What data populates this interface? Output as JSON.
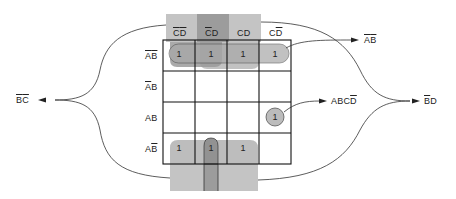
{
  "diagram": {
    "type": "karnaugh-map",
    "variables": [
      "A",
      "B",
      "C",
      "D"
    ],
    "columns": [
      {
        "label_parts": [
          {
            "t": "C",
            "bar": true
          },
          {
            "t": "D",
            "bar": true
          }
        ],
        "text": "C̄D̄"
      },
      {
        "label_parts": [
          {
            "t": "C",
            "bar": true
          },
          {
            "t": "D",
            "bar": false
          }
        ],
        "text": "C̄D"
      },
      {
        "label_parts": [
          {
            "t": "C",
            "bar": false
          },
          {
            "t": "D",
            "bar": false
          }
        ],
        "text": "CD"
      },
      {
        "label_parts": [
          {
            "t": "C",
            "bar": false
          },
          {
            "t": "D",
            "bar": true
          }
        ],
        "text": "CD̄"
      }
    ],
    "rows": [
      {
        "label_parts": [
          {
            "t": "A",
            "bar": true
          },
          {
            "t": "B",
            "bar": true
          }
        ],
        "text": "ĀB̄"
      },
      {
        "label_parts": [
          {
            "t": "A",
            "bar": true
          },
          {
            "t": "B",
            "bar": false
          }
        ],
        "text": "ĀB"
      },
      {
        "label_parts": [
          {
            "t": "A",
            "bar": false
          },
          {
            "t": "B",
            "bar": false
          }
        ],
        "text": "AB"
      },
      {
        "label_parts": [
          {
            "t": "A",
            "bar": false
          },
          {
            "t": "B",
            "bar": true
          }
        ],
        "text": "AB̄"
      }
    ],
    "cells": [
      [
        "1",
        "1",
        "1",
        "1"
      ],
      [
        "",
        "",
        "",
        ""
      ],
      [
        "",
        "",
        "",
        "1"
      ],
      [
        "1",
        "1",
        "1",
        ""
      ]
    ],
    "groups": [
      {
        "term": "ĀB̄",
        "term_parts": [
          {
            "t": "A",
            "bar": true
          },
          {
            "t": "B",
            "bar": true
          }
        ],
        "cells": "row 1, all columns"
      },
      {
        "term": "ABCD̄",
        "term_parts": [
          {
            "t": "A",
            "bar": false
          },
          {
            "t": "B",
            "bar": false
          },
          {
            "t": "C",
            "bar": false
          },
          {
            "t": "D",
            "bar": true
          }
        ],
        "cells": "row 3, column 4"
      },
      {
        "term": "B̄C̄",
        "term_parts": [
          {
            "t": "B",
            "bar": true
          },
          {
            "t": "C",
            "bar": true
          }
        ],
        "cells": "rows 1 & 4, columns 1-2 (wrap)"
      },
      {
        "term": "B̄D",
        "term_parts": [
          {
            "t": "B",
            "bar": true
          },
          {
            "t": "D",
            "bar": false
          }
        ],
        "cells": "rows 1 & 4, columns 2-3 (wrap)"
      }
    ],
    "cell_value": "1",
    "colors": {
      "grid_line": "#111111",
      "shade_light": "#c8c8c8",
      "shade_mid": "#a8a8a8",
      "shade_dark": "#8a8a8a",
      "loop_fill": "#b5b5b5",
      "curve": "#333333",
      "background": "#ffffff"
    }
  }
}
